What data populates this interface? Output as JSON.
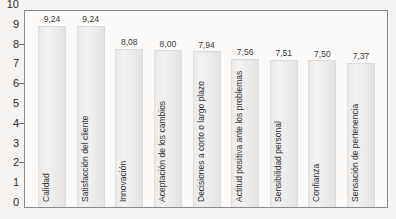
{
  "chart_data": {
    "type": "bar",
    "title": "",
    "xlabel": "",
    "ylabel": "",
    "ylim": [
      0,
      10
    ],
    "ytick_labels": [
      "10",
      "9",
      "8",
      "7",
      "6",
      "5",
      "4",
      "3",
      "2",
      "1",
      "0"
    ],
    "ytick_marks": [
      8,
      6,
      4,
      2
    ],
    "grid": false,
    "legend": null,
    "decimal_separator": ",",
    "categories": [
      "Calidad",
      "Satisfacción del cliente",
      "Innovación",
      "Aceptación de los cambios",
      "Decisiones a corto o largo plazo",
      "Actitud positiva ante los problemas",
      "Sensibilidad personal",
      "Confianza",
      "Sensación de pertenencia"
    ],
    "values": [
      9.24,
      9.24,
      8.08,
      8.0,
      7.94,
      7.56,
      7.51,
      7.5,
      7.37
    ],
    "value_labels": [
      "9,24",
      "9,24",
      "8,08",
      "8,00",
      "7,94",
      "7,56",
      "7,51",
      "7,50",
      "7,37"
    ],
    "colors": {
      "bar_fill": "#efeeec",
      "bar_edge": "#dddcda",
      "axis": "#8a8a8a",
      "text": "#2f2f2f",
      "background": "#f5f4f2",
      "plot_background": "#fbfaf9"
    }
  }
}
